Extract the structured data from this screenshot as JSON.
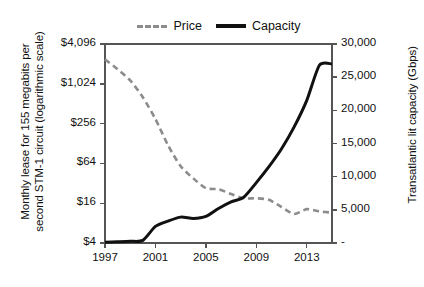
{
  "chart_data": {
    "type": "line",
    "title": "",
    "subtitle": "",
    "xlabel": "",
    "ylabel": "Monthly lease for 155 megabits per second STM-1 circuit (logarithmic scale)",
    "y2label": "Transatlantic lit capacity (Gbps)",
    "x": [
      1997,
      1998,
      1999,
      2000,
      2001,
      2002,
      2003,
      2004,
      2005,
      2006,
      2007,
      2008,
      2009,
      2010,
      2011,
      2012,
      2013,
      2014,
      2015
    ],
    "xlim": [
      1997,
      2015
    ],
    "xticks": [
      1997,
      2001,
      2005,
      2009,
      2013
    ],
    "xticklabels": [
      "1997",
      "2001",
      "2005",
      "2009",
      "2013"
    ],
    "ylim": [
      4,
      4096
    ],
    "yscale": "log",
    "yticks": [
      4,
      16,
      64,
      256,
      1024,
      4096
    ],
    "yticklabels": [
      "$4",
      "$16",
      "$64",
      "$256",
      "$1,024",
      "$4,096"
    ],
    "y2lim": [
      0,
      30000
    ],
    "y2ticks": [
      0,
      5000,
      10000,
      15000,
      20000,
      25000,
      30000
    ],
    "y2ticklabels": [
      "-",
      "5,000",
      "10,000",
      "15,000",
      "20,000",
      "25,000",
      "30,000"
    ],
    "grid": false,
    "legend_position": "top-center",
    "series": [
      {
        "name": "Price",
        "axis": "left",
        "style": "dashed",
        "color": "#8c8c8c",
        "unit": "USD per month",
        "values": [
          2400,
          1700,
          1150,
          640,
          300,
          120,
          58,
          38,
          27,
          26,
          22,
          19,
          19,
          18,
          14,
          11,
          13,
          12,
          11.5
        ]
      },
      {
        "name": "Capacity",
        "axis": "right",
        "style": "solid",
        "color": "#111111",
        "unit": "Gbps",
        "values": [
          120,
          180,
          260,
          400,
          2500,
          3300,
          3900,
          3700,
          4000,
          5200,
          6200,
          6900,
          9100,
          11500,
          14200,
          17500,
          21500,
          26800,
          27000
        ]
      }
    ],
    "annotations": []
  },
  "legend": {
    "items": [
      {
        "label": "Price",
        "icon": "dashed-line-icon"
      },
      {
        "label": "Capacity",
        "icon": "solid-line-icon"
      }
    ]
  },
  "colors": {
    "price_line": "#8c8c8c",
    "capacity_line": "#111111",
    "axis": "#555555",
    "text": "#111111",
    "background": "#ffffff"
  }
}
